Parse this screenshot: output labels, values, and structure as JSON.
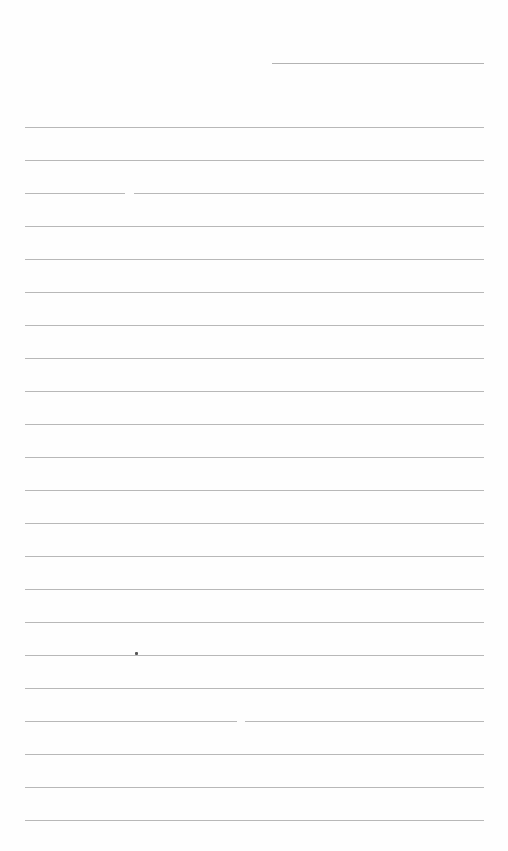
{
  "document": {
    "type": "lined-paper",
    "header_line": {
      "x": 272,
      "y": 63,
      "width": 212
    },
    "rules": {
      "left": 25,
      "right": 484,
      "first_y": 127,
      "spacing": 33,
      "count": 22
    },
    "colors": {
      "paper": "#fefefe",
      "rule": "#b8b8b8"
    }
  }
}
